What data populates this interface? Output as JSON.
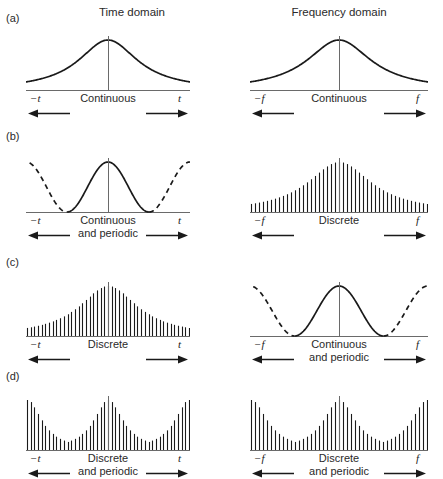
{
  "headers": {
    "left": "Time domain",
    "right": "Frequency domain"
  },
  "rows": [
    {
      "label": "(a)",
      "left": {
        "caption": "Continuous",
        "neg_tick": "−t",
        "pos_tick": "t",
        "kind": "continuous-bell"
      },
      "right": {
        "caption": "Continuous",
        "neg_tick": "−f",
        "pos_tick": "f",
        "kind": "continuous-bell"
      }
    },
    {
      "label": "(b)",
      "left": {
        "caption": "Continuous\nand periodic",
        "neg_tick": "−t",
        "pos_tick": "t",
        "kind": "continuous-periodic"
      },
      "right": {
        "caption": "Discrete",
        "neg_tick": "−f",
        "pos_tick": "f",
        "kind": "discrete-bell"
      }
    },
    {
      "label": "(c)",
      "left": {
        "caption": "Discrete",
        "neg_tick": "−t",
        "pos_tick": "t",
        "kind": "discrete-bell"
      },
      "right": {
        "caption": "Continuous\nand periodic",
        "neg_tick": "−f",
        "pos_tick": "f",
        "kind": "continuous-periodic"
      }
    },
    {
      "label": "(d)",
      "left": {
        "caption": "Discrete\nand periodic",
        "neg_tick": "−t",
        "pos_tick": "t",
        "kind": "discrete-periodic"
      },
      "right": {
        "caption": "Discrete\nand periodic",
        "neg_tick": "−f",
        "pos_tick": "f",
        "kind": "discrete-periodic"
      }
    }
  ],
  "chart_data": {
    "type": "line",
    "xlabel": "",
    "ylabel": "",
    "grid": false,
    "legend": "none",
    "panels": [
      {
        "row": "(a)",
        "side": "left",
        "domain": "Time domain",
        "signal_class": "Continuous",
        "curve": "aperiodic bell (Lorentzian-like) decaying to zero at both ends",
        "x_axis_range": [
          -1,
          1
        ],
        "x_tick_labels": [
          "−t",
          "t"
        ],
        "peak_value": 1.0,
        "edge_value": 0.04,
        "x": [
          -1.0,
          -0.875,
          -0.75,
          -0.625,
          -0.5,
          -0.375,
          -0.25,
          -0.125,
          0.0,
          0.125,
          0.25,
          0.375,
          0.5,
          0.625,
          0.75,
          0.875,
          1.0
        ],
        "y": [
          0.04,
          0.05,
          0.07,
          0.1,
          0.15,
          0.25,
          0.45,
          0.78,
          1.0,
          0.78,
          0.45,
          0.25,
          0.15,
          0.1,
          0.07,
          0.05,
          0.04
        ]
      },
      {
        "row": "(a)",
        "side": "right",
        "domain": "Frequency domain",
        "signal_class": "Continuous",
        "curve": "aperiodic bell (Lorentzian-like) decaying to zero at both ends",
        "x_axis_range": [
          -1,
          1
        ],
        "x_tick_labels": [
          "−f",
          "f"
        ],
        "peak_value": 1.0,
        "edge_value": 0.04,
        "x": [
          -1.0,
          -0.875,
          -0.75,
          -0.625,
          -0.5,
          -0.375,
          -0.25,
          -0.125,
          0.0,
          0.125,
          0.25,
          0.375,
          0.5,
          0.625,
          0.75,
          0.875,
          1.0
        ],
        "y": [
          0.04,
          0.05,
          0.07,
          0.1,
          0.15,
          0.25,
          0.45,
          0.78,
          1.0,
          0.78,
          0.45,
          0.25,
          0.15,
          0.1,
          0.07,
          0.05,
          0.04
        ]
      },
      {
        "row": "(b)",
        "side": "left",
        "domain": "Time domain",
        "signal_class": "Continuous and periodic",
        "curve": "raised cosine, one period solid inside −t..t, dashed continuation outside",
        "period": 1.0,
        "x_axis_range": [
          -1,
          1
        ],
        "x_tick_labels": [
          "−t",
          "t"
        ],
        "peak_value": 1.0,
        "trough_value": 0.0,
        "solid_segment": [
          -0.5,
          0.5
        ],
        "dashed_segments": [
          [
            -1.0,
            -0.5
          ],
          [
            0.5,
            1.0
          ]
        ]
      },
      {
        "row": "(b)",
        "side": "right",
        "domain": "Frequency domain",
        "signal_class": "Discrete",
        "curve": "impulse train with aperiodic bell envelope",
        "impulse_count": 45,
        "x_axis_range": [
          -1,
          1
        ],
        "x_tick_labels": [
          "−f",
          "f"
        ],
        "envelope": "bell",
        "peak_value": 1.0,
        "edge_value": 0.03
      },
      {
        "row": "(c)",
        "side": "left",
        "domain": "Time domain",
        "signal_class": "Discrete",
        "curve": "impulse train with aperiodic bell envelope",
        "impulse_count": 45,
        "x_axis_range": [
          -1,
          1
        ],
        "x_tick_labels": [
          "−t",
          "t"
        ],
        "envelope": "bell",
        "peak_value": 1.0,
        "edge_value": 0.03
      },
      {
        "row": "(c)",
        "side": "right",
        "domain": "Frequency domain",
        "signal_class": "Continuous and periodic",
        "curve": "raised cosine, one period solid inside −f..f, dashed continuation outside",
        "period": 1.0,
        "x_axis_range": [
          -1,
          1
        ],
        "x_tick_labels": [
          "−f",
          "f"
        ],
        "peak_value": 1.0,
        "trough_value": 0.0,
        "solid_segment": [
          -0.5,
          0.5
        ],
        "dashed_segments": [
          [
            -1.0,
            -0.5
          ],
          [
            0.5,
            1.0
          ]
        ]
      },
      {
        "row": "(d)",
        "side": "left",
        "domain": "Time domain",
        "signal_class": "Discrete and periodic",
        "curve": "impulse train with periodic bell envelope repeating every period",
        "impulse_count": 45,
        "envelope": "periodic bell, period 1.0",
        "x_axis_range": [
          -1,
          1
        ],
        "x_tick_labels": [
          "−t",
          "t"
        ],
        "peak_value": 1.0
      },
      {
        "row": "(d)",
        "side": "right",
        "domain": "Frequency domain",
        "signal_class": "Discrete and periodic",
        "curve": "impulse train with periodic bell envelope repeating every period",
        "impulse_count": 45,
        "envelope": "periodic bell, period 1.0",
        "x_axis_range": [
          -1,
          1
        ],
        "x_tick_labels": [
          "−f",
          "f"
        ],
        "peak_value": 1.0
      }
    ]
  },
  "colors": {
    "ink": "#1a1a1a",
    "axis": "#6a6a6a",
    "background": "#ffffff"
  }
}
